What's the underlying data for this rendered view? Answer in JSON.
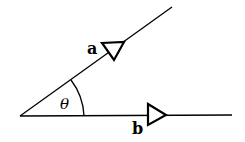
{
  "diagram": {
    "type": "vector-angle",
    "vectors": [
      {
        "label": "a",
        "direction": "upper-right"
      },
      {
        "label": "b",
        "direction": "right"
      }
    ],
    "angle": {
      "label": "θ"
    },
    "colors": {
      "stroke": "#000000",
      "background": "#ffffff"
    }
  }
}
